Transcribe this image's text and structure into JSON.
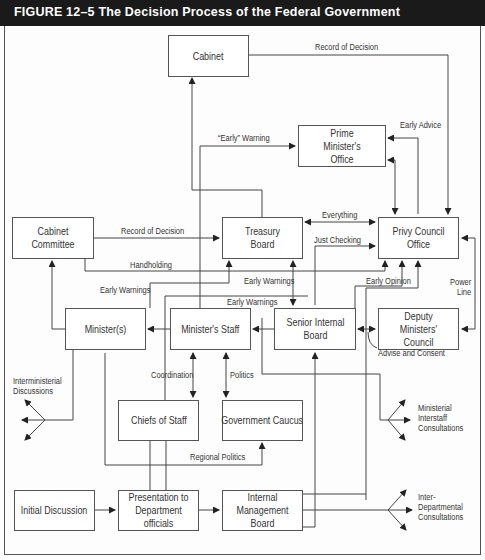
{
  "header": {
    "title": "FIGURE 12–5  The Decision Process of the Federal Government",
    "background": "#1a1a1a",
    "text_color": "#ffffff"
  },
  "nodes": {
    "cabinet": "Cabinet",
    "pmo": "Prime Minister's Office",
    "cabinet_committee": "Cabinet Committee",
    "treasury_board": "Treasury Board",
    "privy_council_office": "Privy Council Office",
    "ministers": "Minister(s)",
    "ministers_staff": "Minister's Staff",
    "senior_internal_board": "Senior Internal Board",
    "deputy_ministers_council": "Deputy Ministers' Council",
    "chiefs_of_staff": "Chiefs of Staff",
    "government_caucus": "Government Caucus",
    "initial_discussion": "Initial Discussion",
    "presentation": "Presentation to Department officials",
    "internal_management_board": "Internal Management Board"
  },
  "edge_labels": {
    "record_of_decision_top": "Record of Decision",
    "early_advice": "Early Advice",
    "early_warning_quoted": "“Early” Warning",
    "record_of_decision_cc": "Record of Decision",
    "everything": "Everything",
    "just_checking": "Just Checking",
    "handholding": "Handholding",
    "early_warnings_1": "Early Warnings",
    "early_warnings_2": "Early Warnings",
    "early_warnings_3": "Early Warnings",
    "early_opinion": "Early Opinion",
    "power_line": "Power Line",
    "advise_and_consent": "Advise and Consent",
    "coordination": "Coordination",
    "politics": "Politics",
    "regional_politics": "Regional Politics",
    "interministerial": "Interministerial Discussions",
    "ministerial_interstaff": "Ministerial Interstaff Consultations",
    "interdepartmental": "Inter-Departmental Consultations"
  }
}
